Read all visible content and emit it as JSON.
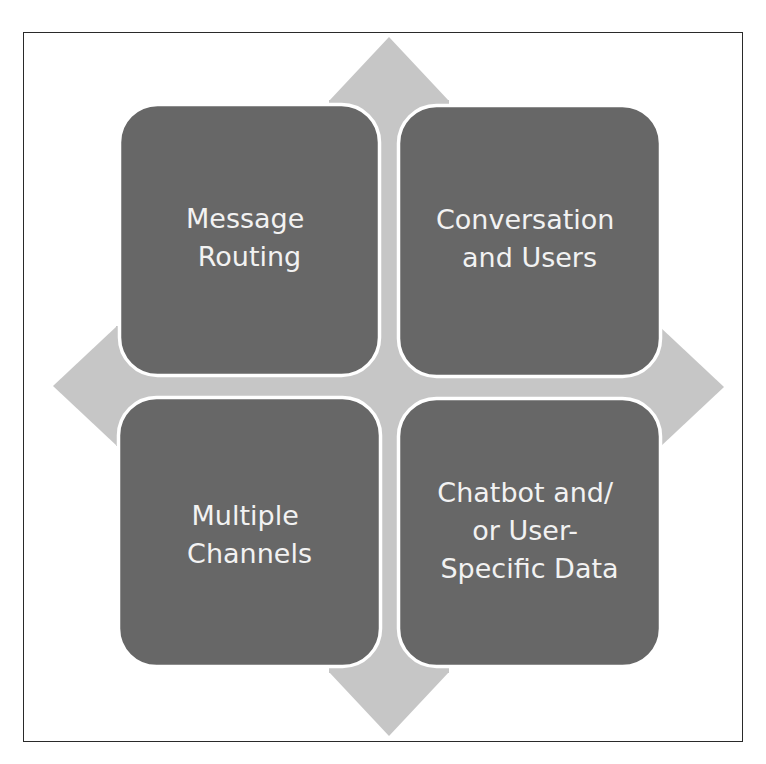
{
  "diagram": {
    "type": "four-way-arrow-matrix",
    "colors": {
      "box_fill": "#676767",
      "box_border": "#ffffff",
      "arrow_fill": "#c6c6c6",
      "text": "#f2f2f2",
      "frame_border": "#2a2a2a"
    },
    "quadrants": [
      {
        "id": "top-left",
        "lines": [
          "Message",
          "Routing"
        ]
      },
      {
        "id": "top-right",
        "lines": [
          "Conversation",
          "and Users"
        ]
      },
      {
        "id": "bottom-left",
        "lines": [
          "Multiple",
          "Channels"
        ]
      },
      {
        "id": "bottom-right",
        "lines": [
          "Chatbot and/",
          "or User-",
          "Specific Data"
        ]
      }
    ]
  }
}
